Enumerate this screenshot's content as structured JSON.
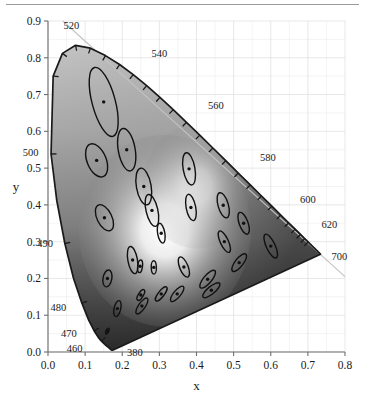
{
  "figure": {
    "kind": "cie-1931-chromaticity-diagram-with-macadam-ellipses",
    "top_rule": true
  },
  "axes": {
    "x_label": "x",
    "y_label": "y",
    "x_ticks": [
      "0.0",
      "0.1",
      "0.2",
      "0.3",
      "0.4",
      "0.5",
      "0.6",
      "0.7",
      "0.8"
    ],
    "y_ticks": [
      "0.0",
      "0.1",
      "0.2",
      "0.3",
      "0.4",
      "0.5",
      "0.6",
      "0.7",
      "0.8",
      "0.9"
    ],
    "x_lim": [
      0.0,
      0.8
    ],
    "y_lim": [
      0.0,
      0.9
    ],
    "x_tick_step": 0.1,
    "y_tick_step": 0.1,
    "minor_grid_step": 0.05,
    "grid": true,
    "grid_color": "#d9d9d9"
  },
  "wavelength_labels": [
    {
      "text": "520",
      "x": 0.074,
      "y": 0.834,
      "lx": 0.063,
      "ly": 0.888,
      "anchor": "middle"
    },
    {
      "text": "540",
      "x": 0.229,
      "y": 0.754,
      "lx": 0.3,
      "ly": 0.812,
      "anchor": "middle"
    },
    {
      "text": "560",
      "x": 0.373,
      "y": 0.624,
      "lx": 0.452,
      "ly": 0.672,
      "anchor": "middle"
    },
    {
      "text": "580",
      "x": 0.513,
      "y": 0.486,
      "lx": 0.592,
      "ly": 0.531,
      "anchor": "middle"
    },
    {
      "text": "600",
      "x": 0.627,
      "y": 0.373,
      "lx": 0.7,
      "ly": 0.417,
      "anchor": "middle"
    },
    {
      "text": "620",
      "x": 0.691,
      "y": 0.308,
      "lx": 0.758,
      "ly": 0.347,
      "anchor": "middle"
    },
    {
      "text": "700",
      "x": 0.735,
      "y": 0.265,
      "lx": 0.785,
      "ly": 0.262,
      "anchor": "middle"
    },
    {
      "text": "500",
      "x": 0.008,
      "y": 0.538,
      "lx": -0.047,
      "ly": 0.545,
      "anchor": "middle"
    },
    {
      "text": "490",
      "x": 0.045,
      "y": 0.295,
      "lx": -0.008,
      "ly": 0.297,
      "anchor": "middle"
    },
    {
      "text": "480",
      "x": 0.091,
      "y": 0.133,
      "lx": 0.028,
      "ly": 0.123,
      "anchor": "middle"
    },
    {
      "text": "470",
      "x": 0.124,
      "y": 0.058,
      "lx": 0.056,
      "ly": 0.052,
      "anchor": "middle"
    },
    {
      "text": "460",
      "x": 0.144,
      "y": 0.03,
      "lx": 0.072,
      "ly": 0.01,
      "anchor": "middle"
    },
    {
      "text": "380",
      "x": 0.175,
      "y": 0.005,
      "lx": 0.234,
      "ly": 0.0,
      "anchor": "middle"
    }
  ],
  "chart_data": {
    "type": "scatter",
    "title": "",
    "xlabel": "x",
    "ylabel": "y",
    "xlim": [
      0.0,
      0.8
    ],
    "ylim": [
      0.0,
      0.9
    ],
    "grid": true,
    "legend": "none",
    "series": [
      {
        "name": "MacAdam ellipses (10x scale)",
        "notes": "centers are CIE 1931 (x,y); a = semi-major axis, b = semi-minor axis, theta = CCW rotation in degrees from +x",
        "points": [
          {
            "x": 0.16,
            "y": 0.057,
            "a": 0.0085,
            "b": 0.0035,
            "theta": 62
          },
          {
            "x": 0.187,
            "y": 0.118,
            "a": 0.022,
            "b": 0.009,
            "theta": 77
          },
          {
            "x": 0.253,
            "y": 0.125,
            "a": 0.0255,
            "b": 0.009,
            "theta": 55
          },
          {
            "x": 0.15,
            "y": 0.68,
            "a": 0.096,
            "b": 0.0315,
            "theta": 105
          },
          {
            "x": 0.131,
            "y": 0.521,
            "a": 0.047,
            "b": 0.026,
            "theta": 112
          },
          {
            "x": 0.212,
            "y": 0.55,
            "a": 0.058,
            "b": 0.023,
            "theta": 100
          },
          {
            "x": 0.258,
            "y": 0.45,
            "a": 0.05,
            "b": 0.02,
            "theta": 100
          },
          {
            "x": 0.152,
            "y": 0.365,
            "a": 0.038,
            "b": 0.02,
            "theta": 116
          },
          {
            "x": 0.28,
            "y": 0.385,
            "a": 0.044,
            "b": 0.016,
            "theta": 103
          },
          {
            "x": 0.38,
            "y": 0.498,
            "a": 0.044,
            "b": 0.016,
            "theta": 100
          },
          {
            "x": 0.16,
            "y": 0.2,
            "a": 0.023,
            "b": 0.012,
            "theta": 80
          },
          {
            "x": 0.228,
            "y": 0.25,
            "a": 0.037,
            "b": 0.013,
            "theta": 100
          },
          {
            "x": 0.305,
            "y": 0.323,
            "a": 0.027,
            "b": 0.0098,
            "theta": 100
          },
          {
            "x": 0.385,
            "y": 0.393,
            "a": 0.036,
            "b": 0.013,
            "theta": 101
          },
          {
            "x": 0.472,
            "y": 0.399,
            "a": 0.035,
            "b": 0.014,
            "theta": 106
          },
          {
            "x": 0.527,
            "y": 0.35,
            "a": 0.031,
            "b": 0.012,
            "theta": 110
          },
          {
            "x": 0.475,
            "y": 0.3,
            "a": 0.0315,
            "b": 0.011,
            "theta": 115
          },
          {
            "x": 0.6,
            "y": 0.288,
            "a": 0.035,
            "b": 0.012,
            "theta": 115
          },
          {
            "x": 0.366,
            "y": 0.231,
            "a": 0.029,
            "b": 0.0115,
            "theta": 112
          },
          {
            "x": 0.285,
            "y": 0.23,
            "a": 0.018,
            "b": 0.007,
            "theta": 92
          },
          {
            "x": 0.248,
            "y": 0.233,
            "a": 0.017,
            "b": 0.0065,
            "theta": 83
          },
          {
            "x": 0.25,
            "y": 0.155,
            "a": 0.0165,
            "b": 0.0065,
            "theta": 58
          },
          {
            "x": 0.305,
            "y": 0.158,
            "a": 0.0235,
            "b": 0.008,
            "theta": 52
          },
          {
            "x": 0.348,
            "y": 0.158,
            "a": 0.026,
            "b": 0.0095,
            "theta": 50
          },
          {
            "x": 0.43,
            "y": 0.198,
            "a": 0.03,
            "b": 0.011,
            "theta": 50
          },
          {
            "x": 0.44,
            "y": 0.168,
            "a": 0.029,
            "b": 0.01,
            "theta": 40
          },
          {
            "x": 0.515,
            "y": 0.243,
            "a": 0.029,
            "b": 0.011,
            "theta": 52
          }
        ]
      }
    ],
    "spectral_locus": [
      [
        0.1741,
        0.005
      ],
      [
        0.174,
        0.005
      ],
      [
        0.1738,
        0.0049
      ],
      [
        0.1736,
        0.0049
      ],
      [
        0.1733,
        0.0048
      ],
      [
        0.173,
        0.0048
      ],
      [
        0.1726,
        0.0048
      ],
      [
        0.1721,
        0.0048
      ],
      [
        0.1714,
        0.0051
      ],
      [
        0.1703,
        0.0058
      ],
      [
        0.1689,
        0.0069
      ],
      [
        0.1669,
        0.0086
      ],
      [
        0.1644,
        0.0109
      ],
      [
        0.1611,
        0.0138
      ],
      [
        0.1566,
        0.0177
      ],
      [
        0.151,
        0.0227
      ],
      [
        0.144,
        0.0297
      ],
      [
        0.1355,
        0.0399
      ],
      [
        0.1241,
        0.0578
      ],
      [
        0.1096,
        0.0868
      ],
      [
        0.0913,
        0.1327
      ],
      [
        0.0687,
        0.2007
      ],
      [
        0.0454,
        0.295
      ],
      [
        0.0235,
        0.4127
      ],
      [
        0.0082,
        0.5384
      ],
      [
        0.0139,
        0.7502
      ],
      [
        0.0389,
        0.812
      ],
      [
        0.0743,
        0.8338
      ],
      [
        0.1142,
        0.8262
      ],
      [
        0.1547,
        0.8059
      ],
      [
        0.1929,
        0.7816
      ],
      [
        0.2296,
        0.7543
      ],
      [
        0.2658,
        0.7243
      ],
      [
        0.3016,
        0.6923
      ],
      [
        0.3373,
        0.6589
      ],
      [
        0.3731,
        0.6245
      ],
      [
        0.4087,
        0.5896
      ],
      [
        0.4441,
        0.5547
      ],
      [
        0.4788,
        0.5202
      ],
      [
        0.5125,
        0.4866
      ],
      [
        0.5448,
        0.4544
      ],
      [
        0.5752,
        0.4242
      ],
      [
        0.6029,
        0.3965
      ],
      [
        0.627,
        0.3725
      ],
      [
        0.6482,
        0.3514
      ],
      [
        0.6658,
        0.334
      ],
      [
        0.6801,
        0.3197
      ],
      [
        0.6915,
        0.3083
      ],
      [
        0.7006,
        0.2993
      ],
      [
        0.7079,
        0.292
      ],
      [
        0.714,
        0.2859
      ],
      [
        0.719,
        0.2809
      ],
      [
        0.723,
        0.277
      ],
      [
        0.726,
        0.274
      ],
      [
        0.7283,
        0.2717
      ],
      [
        0.73,
        0.27
      ],
      [
        0.7311,
        0.2689
      ],
      [
        0.732,
        0.268
      ],
      [
        0.7327,
        0.2673
      ],
      [
        0.7334,
        0.2666
      ],
      [
        0.734,
        0.266
      ]
    ],
    "spectral_ticks": [
      [
        0.0082,
        0.5384
      ],
      [
        0.0139,
        0.7502
      ],
      [
        0.0389,
        0.812
      ],
      [
        0.0743,
        0.8338
      ],
      [
        0.1142,
        0.8262
      ],
      [
        0.1547,
        0.8059
      ],
      [
        0.1929,
        0.7816
      ],
      [
        0.2296,
        0.7543
      ],
      [
        0.2658,
        0.7243
      ],
      [
        0.3016,
        0.6923
      ],
      [
        0.3373,
        0.6589
      ],
      [
        0.3731,
        0.6245
      ],
      [
        0.4087,
        0.5896
      ],
      [
        0.4441,
        0.5547
      ],
      [
        0.4788,
        0.5202
      ],
      [
        0.5125,
        0.4866
      ],
      [
        0.5448,
        0.4544
      ],
      [
        0.5752,
        0.4242
      ],
      [
        0.6029,
        0.3965
      ],
      [
        0.627,
        0.3725
      ],
      [
        0.6482,
        0.3514
      ],
      [
        0.6658,
        0.334
      ],
      [
        0.6801,
        0.3197
      ],
      [
        0.6915,
        0.3083
      ],
      [
        0.7006,
        0.2993
      ],
      [
        0.0454,
        0.295
      ],
      [
        0.0913,
        0.1327
      ],
      [
        0.1241,
        0.0578
      ],
      [
        0.144,
        0.0297
      ]
    ],
    "daylight_line": [
      [
        0.04,
        0.9
      ],
      [
        0.8,
        0.205
      ]
    ]
  }
}
